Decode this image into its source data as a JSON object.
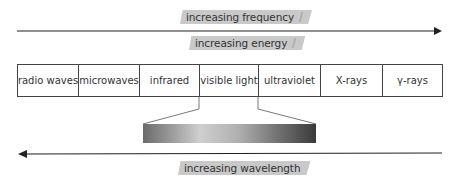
{
  "diagram": {
    "top_labels": {
      "frequency": "increasing frequency",
      "energy": "increasing energy"
    },
    "bottom_label": "increasing wavelength",
    "bands": [
      {
        "label": "radio waves",
        "width": 61
      },
      {
        "label": "microwaves",
        "width": 61
      },
      {
        "label": "infrared",
        "width": 60
      },
      {
        "label": "visible light",
        "width": 59
      },
      {
        "label": "ultraviolet",
        "width": 62
      },
      {
        "label": "X-rays",
        "width": 62
      },
      {
        "label": "γ-rays",
        "width": 61
      }
    ],
    "visible_gradient": {
      "colors": [
        "#6a6a6a",
        "#c8c8c8",
        "#9a9a9a",
        "#3a3a3a"
      ]
    },
    "arrows": {
      "top_direction": "right",
      "bottom_direction": "left",
      "color": "#222222"
    }
  }
}
